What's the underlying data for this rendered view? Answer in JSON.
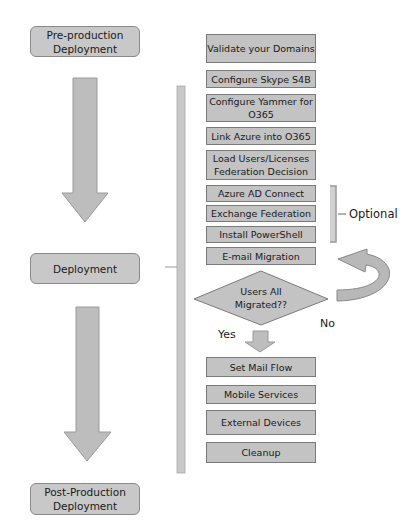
{
  "phases": [
    {
      "label": "Pre-production\nDeployment"
    },
    {
      "label": "Deployment"
    },
    {
      "label": "Post-Production\nDeployment"
    }
  ],
  "steps": [
    {
      "label": "Validate your Domains"
    },
    {
      "label": "Configure Skype S4B"
    },
    {
      "label": "Configure Yammer for O365"
    },
    {
      "label": "Link Azure into O365"
    },
    {
      "label": "Load Users/Licenses Federation Decision"
    },
    {
      "label": "Azure AD Connect"
    },
    {
      "label": "Exchange Federation"
    },
    {
      "label": "Install PowerShell"
    },
    {
      "label": "E-mail Migration"
    },
    {
      "label": "Set Mail Flow"
    },
    {
      "label": "Mobile Services"
    },
    {
      "label": "External Devices"
    },
    {
      "label": "Cleanup"
    }
  ],
  "decision": {
    "label": "Users All Migrated??",
    "yes": "Yes",
    "no": "No"
  },
  "optional_label": "Optional",
  "colors": {
    "box_fill": "#c3c3c3",
    "box_border": "#7a7a7a",
    "arrow_fill": "#bdbdbd"
  }
}
